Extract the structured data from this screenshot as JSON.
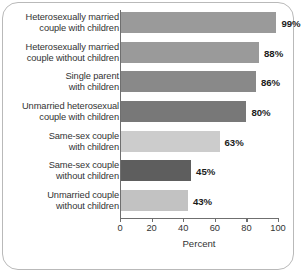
{
  "chart_data": {
    "type": "bar",
    "orientation": "horizontal",
    "title": "",
    "xlabel": "Percent",
    "ylabel": "",
    "xlim": [
      0,
      100
    ],
    "xticks": [
      "0",
      "20",
      "40",
      "60",
      "80",
      "100"
    ],
    "grid": false,
    "legend": false,
    "categories": [
      "Heterosexually married\ncouple with children",
      "Heterosexually married\ncouple without children",
      "Single parent\nwith children",
      "Unmarried heterosexual\ncouple with children",
      "Same-sex couple\nwith children",
      "Same-sex couple\nwithout children",
      "Unmarried couple\nwithout children"
    ],
    "values": [
      99,
      88,
      86,
      80,
      63,
      45,
      43
    ],
    "value_labels": [
      "99%",
      "88%",
      "86%",
      "80%",
      "63%",
      "45%",
      "43%"
    ],
    "bar_colors": [
      "#9a9a9a",
      "#9a9a9a",
      "#898989",
      "#787878",
      "#cccccc",
      "#5e5e5e",
      "#c2c2c2"
    ]
  },
  "frame": {
    "border_color": "#b9b9b9"
  }
}
